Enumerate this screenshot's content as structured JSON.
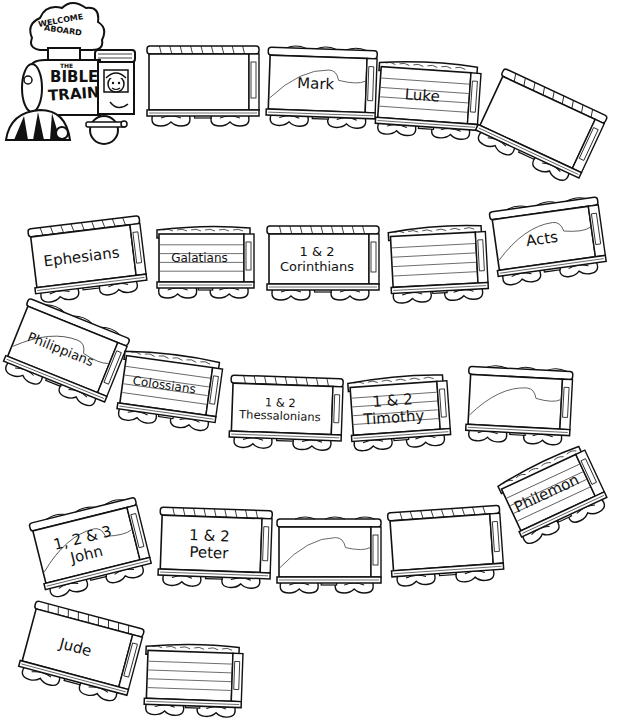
{
  "engine": {
    "banner_line1": "WELCOME",
    "banner_line2": "ABOARD",
    "title_small": "THE",
    "title_line1": "BIBLE",
    "title_line2": "TRAIN"
  },
  "cars": [
    {
      "id": 1,
      "style": "plain",
      "lines": [],
      "x": 145,
      "y": 42,
      "w": 118,
      "h": 90,
      "rot": 0
    },
    {
      "id": 2,
      "style": "curve",
      "lines": [
        "Mark"
      ],
      "x": 265,
      "y": 45,
      "w": 115,
      "h": 88,
      "rot": 2
    },
    {
      "id": 3,
      "style": "striped",
      "lines": [
        "Luke"
      ],
      "x": 375,
      "y": 58,
      "w": 108,
      "h": 85,
      "rot": 4
    },
    {
      "id": 4,
      "style": "plain",
      "lines": [],
      "x": 480,
      "y": 85,
      "w": 120,
      "h": 88,
      "rot": 25
    },
    {
      "id": 5,
      "style": "plain",
      "lines": [
        "Ephesians"
      ],
      "x": 30,
      "y": 218,
      "w": 118,
      "h": 85,
      "rot": -7
    },
    {
      "id": 6,
      "style": "striped",
      "lines": [
        "Galatians"
      ],
      "x": 155,
      "y": 222,
      "w": 103,
      "h": 82,
      "rot": 0
    },
    {
      "id": 7,
      "style": "plain",
      "lines": [
        "1 & 2",
        "Corinthians"
      ],
      "x": 265,
      "y": 222,
      "w": 118,
      "h": 84,
      "rot": 0
    },
    {
      "id": 8,
      "style": "striped",
      "lines": [],
      "x": 388,
      "y": 222,
      "w": 103,
      "h": 85,
      "rot": -3
    },
    {
      "id": 9,
      "style": "curve",
      "lines": [
        "Acts"
      ],
      "x": 492,
      "y": 200,
      "w": 115,
      "h": 85,
      "rot": -8
    },
    {
      "id": 10,
      "style": "curve",
      "lines": [
        "Philippians"
      ],
      "x": 8,
      "y": 312,
      "w": 115,
      "h": 88,
      "rot": 22
    },
    {
      "id": 11,
      "style": "striped",
      "lines": [
        "Colossians"
      ],
      "x": 118,
      "y": 350,
      "w": 105,
      "h": 82,
      "rot": 8
    },
    {
      "id": 12,
      "style": "plain",
      "lines": [
        "1 & 2",
        "Thessalonians"
      ],
      "x": 228,
      "y": 373,
      "w": 118,
      "h": 82,
      "rot": 2
    },
    {
      "id": 13,
      "style": "striped",
      "lines": [
        "1 & 2",
        "Timothy"
      ],
      "x": 348,
      "y": 372,
      "w": 105,
      "h": 82,
      "rot": -4
    },
    {
      "id": 14,
      "style": "curve",
      "lines": [],
      "x": 465,
      "y": 365,
      "w": 110,
      "h": 84,
      "rot": 3
    },
    {
      "id": 15,
      "style": "curve",
      "lines": [
        "1, 2 & 3",
        "John"
      ],
      "x": 35,
      "y": 505,
      "w": 115,
      "h": 88,
      "rot": -14
    },
    {
      "id": 16,
      "style": "plain",
      "lines": [
        "1 & 2",
        "Peter"
      ],
      "x": 157,
      "y": 505,
      "w": 118,
      "h": 88,
      "rot": 2
    },
    {
      "id": 17,
      "style": "curve",
      "lines": [],
      "x": 275,
      "y": 515,
      "w": 110,
      "h": 84,
      "rot": 0
    },
    {
      "id": 18,
      "style": "plain",
      "lines": [],
      "x": 388,
      "y": 505,
      "w": 118,
      "h": 84,
      "rot": -4
    },
    {
      "id": 19,
      "style": "striped",
      "lines": [
        "Philemon"
      ],
      "x": 505,
      "y": 455,
      "w": 100,
      "h": 80,
      "rot": -25
    },
    {
      "id": 20,
      "style": "plain",
      "lines": [
        "Jude"
      ],
      "x": 22,
      "y": 610,
      "w": 118,
      "h": 88,
      "rot": 15
    },
    {
      "id": 21,
      "style": "striped",
      "lines": [],
      "x": 143,
      "y": 640,
      "w": 103,
      "h": 82,
      "rot": 2
    }
  ]
}
